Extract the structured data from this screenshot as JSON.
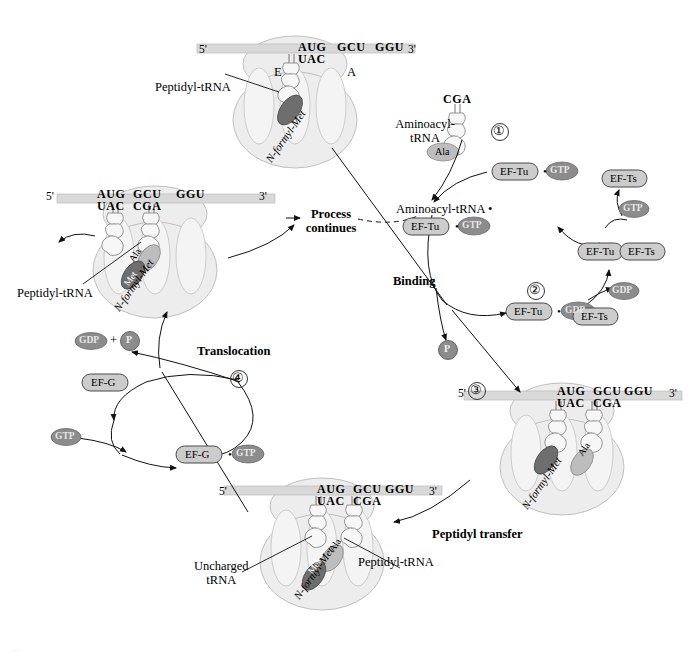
{
  "figure": {
    "background": "#ffffff",
    "ink": "#000000"
  },
  "colors": {
    "ribosome_large": "#eeeeee",
    "ribosome_small": "#f0f0f0",
    "site_oval": "#f4f4f4",
    "mrna_bar": "#d9d9d9",
    "trna_fill": "#f7f7f7",
    "met_fill": "#6e6e6e",
    "ala_fill": "#bdbdbd",
    "factor_fill": "#cccccc",
    "nucleotide_fill": "#8c8c8c",
    "outline": "#555555"
  },
  "ribosomes": [
    {
      "id": "ribosome-top",
      "stage_note": "start of cycle, peptidyl-tRNA in P site, A site empty",
      "mrna": {
        "five_prime": "5'",
        "three_prime": "3'"
      },
      "codons": [
        "AUG",
        "GCU",
        "GGU"
      ],
      "anticodons": [
        "UAC"
      ],
      "sites": [
        "E",
        "A"
      ],
      "labels": {
        "peptidyl_trna": "Peptidyl-tRNA",
        "nformyl_met": "N-formyl-Met"
      },
      "amino_acids": [
        "Met"
      ]
    },
    {
      "id": "ribosome-right",
      "stage_note": "after binding, two tRNAs occupy P and A sites",
      "mrna": {
        "five_prime": "5'",
        "three_prime": "3'"
      },
      "codons": [
        "AUG",
        "GCU",
        "GGU"
      ],
      "anticodons": [
        "UAC",
        "CGA"
      ],
      "labels": {
        "nformyl_met": "N-formyl-Met"
      },
      "amino_acids": [
        "Met",
        "Ala"
      ]
    },
    {
      "id": "ribosome-bottom",
      "stage_note": "after peptidyl transfer, dipeptide on A-site tRNA",
      "mrna": {
        "five_prime": "5'",
        "three_prime": "3'"
      },
      "codons": [
        "AUG",
        "GCU",
        "GGU"
      ],
      "anticodons": [
        "UAC",
        "CGA"
      ],
      "labels": {
        "uncharged_trna": "Uncharged\ntRNA",
        "peptidyl_trna": "Peptidyl-tRNA",
        "nformyl_met": "N-formyl-Met"
      },
      "amino_acids": [
        "Met",
        "Ala"
      ]
    },
    {
      "id": "ribosome-left",
      "stage_note": "after translocation, ribosome advanced one codon",
      "mrna": {
        "five_prime": "5'",
        "three_prime": "3'"
      },
      "codons": [
        "AUG",
        "GCU",
        "GGU"
      ],
      "anticodons": [
        "UAC",
        "CGA"
      ],
      "labels": {
        "peptidyl_trna": "Peptidyl-tRNA",
        "nformyl_met": "N-formyl-Met"
      },
      "amino_acids": [
        "Met",
        "Ala"
      ]
    }
  ],
  "aminoacyl_trna": {
    "label": "Aminoacyl-\ntRNA",
    "anticodon": "CGA",
    "amino_acid": "Ala"
  },
  "steps": [
    {
      "number": "①",
      "name": "binding-step"
    },
    {
      "number": "②",
      "name": "ef-tu-regeneration-step"
    },
    {
      "number": "③",
      "name": "peptidyl-transfer-step"
    },
    {
      "number": "④",
      "name": "translocation-step"
    }
  ],
  "process_labels": {
    "binding": "Binding",
    "peptidyl_transfer": "Peptidyl transfer",
    "translocation": "Translocation",
    "process_continues": "Process\ncontinues"
  },
  "eftu_cycle": {
    "complex_aatrna": "Aminoacyl-tRNA •",
    "eftu_gtp_bound": {
      "factor": "EF-Tu",
      "dot": "•",
      "nucleotide": "GTP"
    },
    "eftu_gtp_free": {
      "factor": "EF-Tu",
      "dot": "•",
      "nucleotide": "GTP"
    },
    "eftu_gdp": {
      "factor": "EF-Tu",
      "dot": "•",
      "nucleotide": "GDP"
    },
    "eftu_efts": {
      "left": "EF-Tu",
      "right": "EF-Ts"
    },
    "efts_free_top": "EF-Ts",
    "efts_free_bottom": "EF-Ts",
    "gtp_in": "GTP",
    "gdp_out": "GDP",
    "phosphate": "P"
  },
  "efg_cycle": {
    "gdp": "GDP",
    "plus": "+",
    "phosphate": "P",
    "efg": "EF-G",
    "gtp_in": "GTP",
    "efg_gtp": {
      "factor": "EF-G",
      "dot": "•",
      "nucleotide": "GTP"
    }
  },
  "watermark": "..."
}
